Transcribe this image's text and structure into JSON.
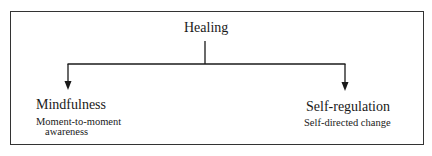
{
  "diagram": {
    "type": "tree",
    "root": {
      "label": "Healing"
    },
    "children": [
      {
        "title": "Mindfulness",
        "description_line1": "Moment-to-moment",
        "description_line2": "awareness"
      },
      {
        "title": "Self-regulation",
        "description_line1": "Self-directed change"
      }
    ],
    "colors": {
      "line": "#1a1a1a",
      "frame": "#333333",
      "text": "#1a1a1a",
      "background": "#ffffff"
    }
  }
}
